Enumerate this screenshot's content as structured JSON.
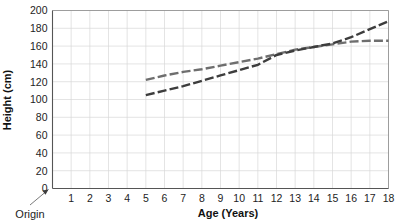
{
  "chart_data": {
    "type": "line",
    "title": "",
    "xlabel": "Age (Years)",
    "ylabel": "Height (cm)",
    "xlim": [
      0,
      18
    ],
    "ylim": [
      0,
      200
    ],
    "grid": true,
    "legend": "none",
    "x_ticks": [
      "0",
      "1",
      "2",
      "3",
      "4",
      "5",
      "6",
      "7",
      "8",
      "9",
      "10",
      "11",
      "12",
      "13",
      "14",
      "15",
      "16",
      "17",
      "18"
    ],
    "y_ticks": [
      "0",
      "20",
      "40",
      "60",
      "80",
      "100",
      "120",
      "140",
      "160",
      "180",
      "200"
    ],
    "annotations": [
      {
        "text": "Origin",
        "target_x": 0,
        "target_y": 0
      }
    ],
    "x": [
      5,
      6,
      7,
      8,
      9,
      10,
      11,
      12,
      13,
      14,
      15,
      16,
      17,
      18
    ],
    "series": [
      {
        "name": "series-upper",
        "style": "dashed",
        "color": "#6e6e6e",
        "values": [
          122,
          127,
          131,
          134,
          138,
          142,
          146,
          151,
          156,
          159,
          162,
          165,
          166,
          166
        ]
      },
      {
        "name": "series-lower",
        "style": "dashed",
        "color": "#3d3d3d",
        "values": [
          105,
          110,
          115,
          121,
          127,
          133,
          139,
          150,
          155,
          159,
          163,
          170,
          179,
          188
        ]
      }
    ]
  },
  "labels": {
    "origin": "Origin",
    "x_axis_title": "Age (Years)",
    "y_axis_title": "Height (cm)"
  }
}
